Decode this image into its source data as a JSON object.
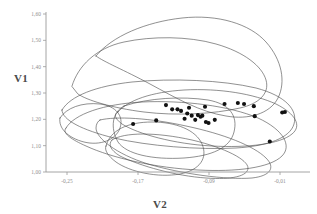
{
  "chart_data": {
    "type": "scatter",
    "title": "",
    "subtitle": "",
    "xlabel": "V2",
    "ylabel": "V1",
    "xlim": [
      -0.28,
      0.005
    ],
    "ylim": [
      1.0,
      1.62
    ],
    "grid": false,
    "legend": null,
    "x_tick_labels": [
      "-0,25",
      "-0,17",
      "-0,09",
      "-0,01"
    ],
    "x_tick_values": [
      -0.25,
      -0.17,
      -0.09,
      -0.01
    ],
    "y_tick_labels": [
      "1,00",
      "1,10",
      "1,20",
      "1,30",
      "1,40",
      "1,50",
      "1,60"
    ],
    "y_tick_values": [
      1.0,
      1.1,
      1.2,
      1.3,
      1.4,
      1.5,
      1.6
    ],
    "decimal_separator": ",",
    "marker": "filled-circle",
    "marker_color": "#111111",
    "contour_color": "#4d4d4d",
    "points": [
      {
        "x": -0.1755,
        "y": 1.182
      },
      {
        "x": -0.1495,
        "y": 1.196
      },
      {
        "x": -0.1385,
        "y": 1.254
      },
      {
        "x": -0.1315,
        "y": 1.238
      },
      {
        "x": -0.1255,
        "y": 1.238
      },
      {
        "x": -0.1215,
        "y": 1.232
      },
      {
        "x": -0.1175,
        "y": 1.202
      },
      {
        "x": -0.1145,
        "y": 1.222
      },
      {
        "x": -0.1125,
        "y": 1.244
      },
      {
        "x": -0.1095,
        "y": 1.214
      },
      {
        "x": -0.1055,
        "y": 1.198
      },
      {
        "x": -0.1025,
        "y": 1.216
      },
      {
        "x": -0.0995,
        "y": 1.21
      },
      {
        "x": -0.0975,
        "y": 1.214
      },
      {
        "x": -0.0945,
        "y": 1.248
      },
      {
        "x": -0.0935,
        "y": 1.19
      },
      {
        "x": -0.0905,
        "y": 1.186
      },
      {
        "x": -0.0835,
        "y": 1.198
      },
      {
        "x": -0.0725,
        "y": 1.258
      },
      {
        "x": -0.0575,
        "y": 1.262
      },
      {
        "x": -0.0505,
        "y": 1.258
      },
      {
        "x": -0.0395,
        "y": 1.25
      },
      {
        "x": -0.0385,
        "y": 1.212
      },
      {
        "x": -0.0215,
        "y": 1.116
      },
      {
        "x": -0.0075,
        "y": 1.226
      },
      {
        "x": -0.0045,
        "y": 1.228
      }
    ],
    "contours": [
      {
        "name": "contour-outer-upper",
        "path": "M 72,86 C 78,66 96,48 124,42 C 152,36 188,36 216,44 C 244,52 262,66 266,80 C 270,94 258,104 240,108 C 214,114 176,116 144,112 C 112,108 86,100 78,94 Z"
      },
      {
        "name": "contour-upper-crest",
        "path": "M 96,56 C 112,36 146,22 182,18 C 218,14 250,24 266,42 C 282,60 286,82 278,98 C 270,114 248,120 226,116 C 200,112 176,98 150,84 C 124,70 104,62 96,56 Z"
      },
      {
        "name": "contour-mid-broad",
        "path": "M 62,110 C 70,96 96,86 132,82 C 172,78 222,80 256,88 C 286,96 298,110 294,124 C 290,138 268,146 236,148 C 198,150 148,146 114,138 C 82,130 62,120 62,110 Z"
      },
      {
        "name": "contour-mid-lens",
        "path": "M 66,128 C 74,114 104,104 142,102 C 184,100 230,106 258,118 C 284,130 292,146 282,156 C 270,168 236,172 198,170 C 156,168 112,158 86,146 C 68,138 62,132 66,128 Z"
      },
      {
        "name": "contour-inner-upper-band",
        "path": "M 118,112 C 128,100 152,92 184,90 C 220,88 254,94 276,104 C 296,114 302,126 292,134 C 280,144 248,148 212,146 C 174,144 138,134 122,124 C 114,118 114,114 118,112 Z"
      },
      {
        "name": "contour-inner-box",
        "path": "M 124,106 C 148,98 182,96 208,100 C 230,104 238,116 234,132 C 230,148 212,156 184,158 C 152,160 126,154 118,142 C 110,128 112,112 124,106 Z"
      },
      {
        "name": "contour-lower-left-lobe",
        "path": "M 106,146 C 110,130 128,122 152,122 C 176,122 196,130 202,144 C 208,158 200,170 180,174 C 158,178 130,172 116,162 C 108,156 104,150 106,146 Z"
      },
      {
        "name": "contour-lower-tail",
        "path": "M 100,120 C 116,116 150,118 186,126 C 224,134 254,146 266,158 C 276,168 270,176 252,178 C 226,180 182,174 148,164 C 116,154 96,138 96,128 C 96,124 98,121 100,120 Z"
      },
      {
        "name": "contour-bottom-sweep",
        "path": "M 112,140 C 124,132 156,132 192,140 C 226,148 248,160 248,168 C 248,176 232,180 206,178 C 176,176 140,166 120,156 C 110,150 108,144 112,140 Z"
      },
      {
        "name": "contour-left-small",
        "path": "M 60,118 C 66,108 82,102 100,104 C 116,106 124,116 120,128 C 116,140 100,146 84,142 C 68,138 58,128 60,118 Z"
      }
    ]
  },
  "axis_titles": {
    "y": "V1",
    "x": "V2"
  }
}
